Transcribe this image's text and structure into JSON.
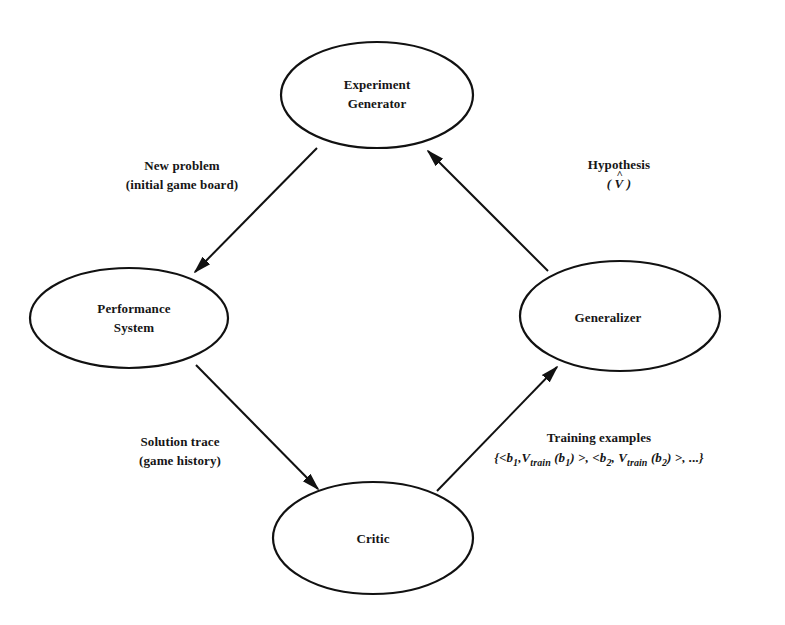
{
  "diagram": {
    "nodes": [
      {
        "id": "experiment_generator",
        "lines": [
          "Experiment",
          "Generator"
        ],
        "cx": 377,
        "cy": 95,
        "rx": 96,
        "ry": 53
      },
      {
        "id": "performance_system",
        "lines": [
          "Performance",
          "System"
        ],
        "cx": 129,
        "cy": 318,
        "rx": 99,
        "ry": 50
      },
      {
        "id": "generalizer",
        "lines": [
          "Generalizer"
        ],
        "cx": 620,
        "cy": 316,
        "rx": 100,
        "ry": 55
      },
      {
        "id": "critic",
        "lines": [
          "Critic"
        ],
        "cx": 373,
        "cy": 538,
        "rx": 100,
        "ry": 56
      }
    ],
    "edges": [
      {
        "from": "experiment_generator",
        "to": "performance_system",
        "label_lines": [
          "New problem",
          "(initial game board)"
        ]
      },
      {
        "from": "performance_system",
        "to": "critic",
        "label_lines": [
          "Solution trace",
          "(game history)"
        ]
      },
      {
        "from": "critic",
        "to": "generalizer",
        "label_lines": [
          "Training examples"
        ],
        "formula": {
          "open": "{<",
          "b1": "b",
          "b1_sub": "1",
          "sep1": ",",
          "v": "V",
          "v_sub": "train",
          "arg1": "(b",
          "arg1_sub": "1",
          "arg1_close": ")",
          "mid": " >, <",
          "b2": "b",
          "b2_sub": "2",
          "sep2": ", ",
          "v2": "V",
          "v2_sub": "train",
          "arg2": "(b",
          "arg2_sub": "2",
          "arg2_close": ") >, ...}"
        }
      },
      {
        "from": "generalizer",
        "to": "experiment_generator",
        "label_lines": [
          "Hypothesis"
        ],
        "formula": {
          "open": "( ",
          "symbol": "V",
          "hat": "^",
          "close": " )"
        }
      }
    ],
    "colors": {
      "stroke": "#111111",
      "background": "#ffffff",
      "text": "#161616"
    }
  }
}
